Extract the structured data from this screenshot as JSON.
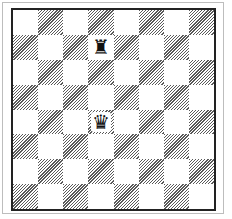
{
  "board": {
    "size": 8,
    "orientation": "white-bottom",
    "light_color": "#ffffff",
    "dark_style": "diagonal-hatch",
    "dark_color": "#5a5a5a",
    "border_color": "#222222"
  },
  "pieces": [
    {
      "square": "d7",
      "row": 1,
      "col": 3,
      "type": "rook",
      "color": "black",
      "glyph": "♜",
      "icon": "black-rook-icon"
    },
    {
      "square": "d4",
      "row": 4,
      "col": 3,
      "type": "queen",
      "color": "black",
      "glyph": "♛",
      "icon": "black-queen-icon"
    }
  ]
}
